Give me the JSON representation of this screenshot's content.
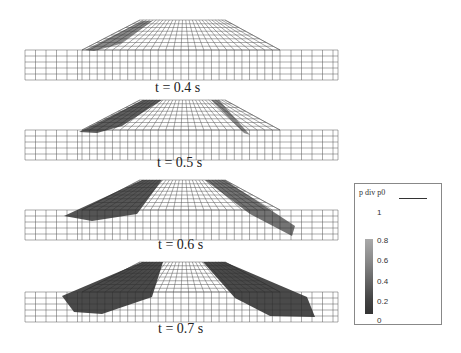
{
  "figure": {
    "panels": [
      {
        "label": "t = 0.4 s",
        "top": 0
      },
      {
        "label": "t = 0.5 s",
        "top": 80
      },
      {
        "label": "t = 0.6 s",
        "top": 160
      },
      {
        "label": "t = 0.7 s",
        "top": 242
      }
    ],
    "legend": {
      "title": "p div p0",
      "ticks": [
        "1",
        "0.8",
        "0.6",
        "0.4",
        "0.2",
        "0"
      ]
    }
  }
}
